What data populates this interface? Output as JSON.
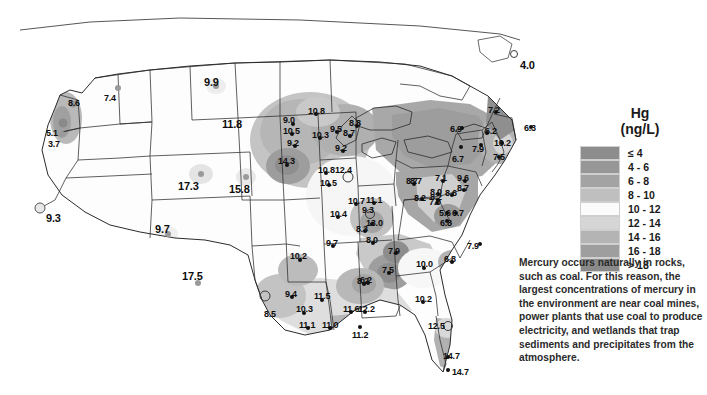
{
  "legend": {
    "title_line1": "Hg",
    "title_line2": "(ng/L)",
    "classes": [
      {
        "label": "≤ 4",
        "color": "#8d8d8d"
      },
      {
        "label": "4 - 6",
        "color": "#979797"
      },
      {
        "label": "6 - 8",
        "color": "#a3a3a3"
      },
      {
        "label": "8 - 10",
        "color": "#bfbfbf"
      },
      {
        "label": "10 - 12",
        "color": "#fbfbfb"
      },
      {
        "label": "12 - 14",
        "color": "#d6d6d6"
      },
      {
        "label": "14 - 16",
        "color": "#b4b4b4"
      },
      {
        "label": "16 - 18",
        "color": "#9e9e9e"
      },
      {
        "label": "> 18",
        "color": "#8a8a8a"
      }
    ]
  },
  "caption": {
    "text": "Mercury occurs naturally in rocks, such as coal. For this reason, the largest concentrations of mercury in the environment are near coal mines, power plants that use coal to produce electricity, and wetlands that trap sediments and precipitates from the atmosphere."
  },
  "chart_data": {
    "type": "map",
    "unit": "ng/L",
    "variable": "Hg",
    "legend_bins": [
      "≤ 4",
      "4 - 6",
      "6 - 8",
      "8 - 10",
      "10 - 12",
      "12 - 14",
      "14 - 16",
      "16 - 18",
      "> 18"
    ],
    "points": [
      {
        "value": "8.6",
        "x": 73,
        "y": 104,
        "marker": "grey",
        "lx": 68,
        "ly": 99,
        "size": 7
      },
      {
        "value": "5.1",
        "x": 63,
        "y": 123,
        "marker": "grey-dark",
        "lx": 46,
        "ly": 129,
        "size": 9
      },
      {
        "value": "3.7",
        "x": 62,
        "y": 134,
        "marker": "grey",
        "lx": 48,
        "ly": 140,
        "size": 6
      },
      {
        "value": "7.4",
        "x": 118,
        "y": 88,
        "marker": "grey",
        "lx": 104,
        "ly": 94,
        "size": 6
      },
      {
        "value": "9.9",
        "x": 216,
        "y": 86,
        "marker": "grey",
        "lx": 204,
        "ly": 77,
        "size": 6,
        "big": true
      },
      {
        "value": "11.8",
        "x": 238,
        "y": 130,
        "marker": "none",
        "lx": 222,
        "ly": 119,
        "size": 0,
        "big": true
      },
      {
        "value": "17.3",
        "x": 201,
        "y": 174,
        "marker": "grey",
        "lx": 178,
        "ly": 181,
        "size": 6,
        "big": true
      },
      {
        "value": "15.8",
        "x": 246,
        "y": 177,
        "marker": "grey",
        "lx": 229,
        "ly": 184,
        "size": 6,
        "big": true
      },
      {
        "value": "9.3",
        "x": 40,
        "y": 208,
        "marker": "ringlight",
        "lx": 46,
        "ly": 213,
        "size": 9,
        "big": true
      },
      {
        "value": "9.7",
        "x": 168,
        "y": 234,
        "marker": "grey",
        "lx": 155,
        "ly": 224,
        "size": 6,
        "big": true
      },
      {
        "value": "17.5",
        "x": 198,
        "y": 283,
        "marker": "grey",
        "lx": 182,
        "ly": 271,
        "size": 6,
        "big": true
      },
      {
        "value": "8.5",
        "x": 265,
        "y": 296,
        "marker": "ring",
        "lx": 264,
        "ly": 310,
        "size": 9
      },
      {
        "value": "9.4",
        "x": 292,
        "y": 297,
        "marker": "filled",
        "lx": 285,
        "ly": 290,
        "size": 4
      },
      {
        "value": "10.3",
        "x": 304,
        "y": 313,
        "marker": "filled",
        "lx": 296,
        "ly": 305,
        "size": 4
      },
      {
        "value": "11.1",
        "x": 308,
        "y": 328,
        "marker": "filled",
        "lx": 299,
        "ly": 321,
        "size": 4
      },
      {
        "value": "11.5",
        "x": 322,
        "y": 300,
        "marker": "filled",
        "lx": 314,
        "ly": 292,
        "size": 4
      },
      {
        "value": "11.0",
        "x": 330,
        "y": 328,
        "marker": "filled",
        "lx": 322,
        "ly": 321,
        "size": 4
      },
      {
        "value": "11.6",
        "x": 351,
        "y": 312,
        "marker": "filled",
        "lx": 343,
        "ly": 305,
        "size": 4
      },
      {
        "value": "12.2",
        "x": 365,
        "y": 312,
        "marker": "filled",
        "lx": 358,
        "ly": 305,
        "size": 4
      },
      {
        "value": "11.2",
        "x": 360,
        "y": 327,
        "marker": "filled",
        "lx": 352,
        "ly": 331,
        "size": 4
      },
      {
        "value": "8.2",
        "x": 364,
        "y": 284,
        "marker": "filled",
        "lx": 357,
        "ly": 277,
        "size": 4
      },
      {
        "value": "10.2",
        "x": 300,
        "y": 260,
        "marker": "filled",
        "lx": 290,
        "ly": 252,
        "size": 4
      },
      {
        "value": "9.0",
        "x": 293,
        "y": 124,
        "marker": "filled",
        "lx": 283,
        "ly": 116,
        "size": 4
      },
      {
        "value": "10.8",
        "x": 316,
        "y": 114,
        "marker": "filled",
        "lx": 308,
        "ly": 107,
        "size": 4
      },
      {
        "value": "10.5",
        "x": 292,
        "y": 134,
        "marker": "filled",
        "lx": 283,
        "ly": 127,
        "size": 4
      },
      {
        "value": "9.2",
        "x": 295,
        "y": 146,
        "marker": "filled",
        "lx": 287,
        "ly": 139,
        "size": 4
      },
      {
        "value": "10.3",
        "x": 320,
        "y": 138,
        "marker": "filled",
        "lx": 312,
        "ly": 131,
        "size": 4
      },
      {
        "value": "9.5",
        "x": 337,
        "y": 132,
        "marker": "filled",
        "lx": 330,
        "ly": 125,
        "size": 4
      },
      {
        "value": "8.7",
        "x": 350,
        "y": 136,
        "marker": "filled",
        "lx": 343,
        "ly": 129,
        "size": 4
      },
      {
        "value": "9.2",
        "x": 343,
        "y": 151,
        "marker": "filled",
        "lx": 335,
        "ly": 144,
        "size": 4
      },
      {
        "value": "8.8",
        "x": 357,
        "y": 126,
        "marker": "filled",
        "lx": 349,
        "ly": 119,
        "size": 4
      },
      {
        "value": "14.3",
        "x": 287,
        "y": 165,
        "marker": "filled",
        "lx": 278,
        "ly": 157,
        "size": 4
      },
      {
        "value": "10.8",
        "x": 326,
        "y": 173,
        "marker": "filled",
        "lx": 318,
        "ly": 166,
        "size": 4
      },
      {
        "value": "12.4",
        "x": 348,
        "y": 177,
        "marker": "ring",
        "lx": 335,
        "ly": 166,
        "size": 9
      },
      {
        "value": "10.5",
        "x": 329,
        "y": 185,
        "marker": "filled",
        "lx": 320,
        "ly": 179,
        "size": 4
      },
      {
        "value": "10.7",
        "x": 356,
        "y": 204,
        "marker": "filled",
        "lx": 348,
        "ly": 197,
        "size": 4
      },
      {
        "value": "11.1",
        "x": 374,
        "y": 203,
        "marker": "filled",
        "lx": 366,
        "ly": 196,
        "size": 4
      },
      {
        "value": "10.4",
        "x": 338,
        "y": 217,
        "marker": "filled",
        "lx": 330,
        "ly": 210,
        "size": 4
      },
      {
        "value": "9.3",
        "x": 370,
        "y": 214,
        "marker": "ring",
        "lx": 362,
        "ly": 206,
        "size": 8
      },
      {
        "value": "13.0",
        "x": 372,
        "y": 224,
        "marker": "filled",
        "lx": 366,
        "ly": 219,
        "size": 4
      },
      {
        "value": "8.3",
        "x": 365,
        "y": 231,
        "marker": "filled",
        "lx": 356,
        "ly": 225,
        "size": 4
      },
      {
        "value": "8.0",
        "x": 373,
        "y": 243,
        "marker": "filled",
        "lx": 366,
        "ly": 236,
        "size": 4
      },
      {
        "value": "9.7",
        "x": 333,
        "y": 246,
        "marker": "filled",
        "lx": 326,
        "ly": 239,
        "size": 4
      },
      {
        "value": "7.9",
        "x": 396,
        "y": 253,
        "marker": "filled",
        "lx": 388,
        "ly": 247,
        "size": 4
      },
      {
        "value": "7.5",
        "x": 389,
        "y": 273,
        "marker": "filled",
        "lx": 382,
        "ly": 266,
        "size": 4
      },
      {
        "value": "6.2",
        "x": 368,
        "y": 283,
        "marker": "filled",
        "lx": 360,
        "ly": 276,
        "size": 4
      },
      {
        "value": "10.0",
        "x": 424,
        "y": 268,
        "marker": "filled",
        "lx": 416,
        "ly": 260,
        "size": 4
      },
      {
        "value": "6.8",
        "x": 452,
        "y": 262,
        "marker": "filled",
        "lx": 444,
        "ly": 255,
        "size": 4
      },
      {
        "value": "7.9",
        "x": 480,
        "y": 244,
        "marker": "filled",
        "lx": 467,
        "ly": 242,
        "size": 4
      },
      {
        "value": "10.2",
        "x": 423,
        "y": 302,
        "marker": "filled",
        "lx": 415,
        "ly": 295,
        "size": 4
      },
      {
        "value": "12.5",
        "x": 448,
        "y": 326,
        "marker": "ring",
        "lx": 428,
        "ly": 322,
        "size": 8
      },
      {
        "value": "14.7",
        "x": 448,
        "y": 357,
        "marker": "filled",
        "lx": 443,
        "ly": 352,
        "size": 4
      },
      {
        "value": "14.7",
        "x": 448,
        "y": 370,
        "marker": "filled",
        "lx": 452,
        "ly": 368,
        "size": 4
      },
      {
        "value": "8.7",
        "x": 414,
        "y": 184,
        "marker": "filled",
        "lx": 406,
        "ly": 177,
        "size": 4
      },
      {
        "value": "8.2",
        "x": 438,
        "y": 200,
        "marker": "filled",
        "lx": 430,
        "ly": 193,
        "size": 4
      },
      {
        "value": "8.7",
        "x": 419,
        "y": 183,
        "marker": "none",
        "lx": 410,
        "ly": 177,
        "size": 0
      },
      {
        "value": "7.1",
        "x": 443,
        "y": 181,
        "marker": "filled",
        "lx": 435,
        "ly": 174,
        "size": 4
      },
      {
        "value": "9.6",
        "x": 465,
        "y": 181,
        "marker": "filled",
        "lx": 457,
        "ly": 174,
        "size": 4
      },
      {
        "value": "8.0",
        "x": 438,
        "y": 194,
        "marker": "filled",
        "lx": 430,
        "ly": 188,
        "size": 4
      },
      {
        "value": "8.6",
        "x": 452,
        "y": 195,
        "marker": "filled",
        "lx": 445,
        "ly": 189,
        "size": 4
      },
      {
        "value": "8.7",
        "x": 464,
        "y": 190,
        "marker": "filled",
        "lx": 457,
        "ly": 184,
        "size": 4
      },
      {
        "value": "8.2",
        "x": 422,
        "y": 199,
        "marker": "filled",
        "lx": 414,
        "ly": 194,
        "size": 4
      },
      {
        "value": "7.0",
        "x": 437,
        "y": 203,
        "marker": "filled",
        "lx": 429,
        "ly": 198,
        "size": 4
      },
      {
        "value": "5.6",
        "x": 447,
        "y": 213,
        "marker": "filled",
        "lx": 439,
        "ly": 209,
        "size": 4
      },
      {
        "value": "6.7",
        "x": 456,
        "y": 213,
        "marker": "filled",
        "lx": 452,
        "ly": 209,
        "size": 4
      },
      {
        "value": "6.8",
        "x": 447,
        "y": 221,
        "marker": "filled",
        "lx": 440,
        "ly": 219,
        "size": 4
      },
      {
        "value": "6.9",
        "x": 462,
        "y": 128,
        "marker": "filled",
        "lx": 450,
        "ly": 125,
        "size": 4
      },
      {
        "value": "7.2",
        "x": 496,
        "y": 112,
        "marker": "filled",
        "lx": 488,
        "ly": 106,
        "size": 4
      },
      {
        "value": "6.2",
        "x": 487,
        "y": 133,
        "marker": "filled",
        "lx": 485,
        "ly": 127,
        "size": 4
      },
      {
        "value": "7.9",
        "x": 481,
        "y": 145,
        "marker": "filled",
        "lx": 472,
        "ly": 145,
        "size": 4
      },
      {
        "value": "10.2",
        "x": 502,
        "y": 143,
        "marker": "filled",
        "lx": 494,
        "ly": 139,
        "size": 4
      },
      {
        "value": "7.5",
        "x": 499,
        "y": 157,
        "marker": "filled",
        "lx": 493,
        "ly": 153,
        "size": 4
      },
      {
        "value": "6.7",
        "x": 461,
        "y": 147,
        "marker": "filled",
        "lx": 452,
        "ly": 155,
        "size": 4
      },
      {
        "value": "6.3",
        "x": 531,
        "y": 127,
        "marker": "filled",
        "lx": 524,
        "ly": 124,
        "size": 4
      },
      {
        "value": "4.0",
        "x": 514,
        "y": 54,
        "marker": "ring",
        "lx": 520,
        "ly": 60,
        "size": 6,
        "big": true
      }
    ]
  }
}
